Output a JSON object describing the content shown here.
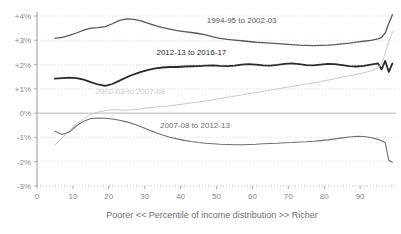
{
  "chart_data": {
    "type": "line",
    "title": "",
    "subtitle": "",
    "xlabel": "Poorer << Percentile of income distribution >> Richer",
    "ylabel": "",
    "xlim": [
      0,
      100
    ],
    "ylim": [
      -3,
      4
    ],
    "grid": true,
    "grid_style": "dotted",
    "legend_position": "inline-labels",
    "x_ticks": [
      0,
      10,
      20,
      30,
      40,
      50,
      60,
      70,
      80,
      90
    ],
    "x_tick_labels": [
      "0",
      "10",
      "20",
      "30",
      "40",
      "50",
      "60",
      "70",
      "80",
      "90"
    ],
    "y_ticks": [
      -3,
      -2,
      -1,
      0,
      1,
      2,
      3,
      4
    ],
    "y_tick_labels": [
      "-3%",
      "-2%",
      "-1%",
      "0%",
      "+1%",
      "+2%",
      "+3%",
      "+4%"
    ],
    "x": [
      5,
      7,
      9,
      11,
      13,
      15,
      17,
      19,
      21,
      23,
      25,
      27,
      29,
      31,
      33,
      35,
      37,
      39,
      41,
      43,
      45,
      47,
      49,
      51,
      53,
      55,
      57,
      59,
      61,
      63,
      65,
      67,
      69,
      71,
      73,
      75,
      77,
      79,
      81,
      83,
      85,
      87,
      89,
      91,
      93,
      95,
      96,
      97,
      98,
      99
    ],
    "series": [
      {
        "name": "1994-95 to 2002-03",
        "color": "#595959",
        "width": 1.3,
        "label_x": 57,
        "label_y": 3.72,
        "values": [
          3.08,
          3.12,
          3.2,
          3.3,
          3.42,
          3.5,
          3.52,
          3.56,
          3.68,
          3.82,
          3.88,
          3.86,
          3.8,
          3.7,
          3.6,
          3.52,
          3.46,
          3.4,
          3.36,
          3.32,
          3.28,
          3.22,
          3.14,
          3.08,
          3.04,
          3.01,
          2.98,
          2.95,
          2.92,
          2.9,
          2.88,
          2.86,
          2.84,
          2.82,
          2.8,
          2.79,
          2.78,
          2.79,
          2.8,
          2.82,
          2.85,
          2.88,
          2.92,
          2.96,
          3.0,
          3.06,
          3.12,
          3.3,
          3.7,
          4.05
        ]
      },
      {
        "name": "2012-13 to 2016-17",
        "color": "#2b2b2b",
        "width": 1.8,
        "label_x": 43,
        "label_y": 2.38,
        "values": [
          1.42,
          1.44,
          1.46,
          1.44,
          1.38,
          1.28,
          1.18,
          1.12,
          1.2,
          1.34,
          1.48,
          1.6,
          1.7,
          1.78,
          1.84,
          1.88,
          1.9,
          1.9,
          1.92,
          1.93,
          1.94,
          1.96,
          1.97,
          1.95,
          1.94,
          1.96,
          2.0,
          2.02,
          2.0,
          1.97,
          1.96,
          1.99,
          2.03,
          2.05,
          2.02,
          1.98,
          1.97,
          2.0,
          2.03,
          2.02,
          1.98,
          1.94,
          1.92,
          1.95,
          2.0,
          2.05,
          1.8,
          2.15,
          1.7,
          2.05
        ]
      },
      {
        "name": "2002-03 to 2007-08",
        "color": "#c9c9c9",
        "width": 1.0,
        "label_x": 26,
        "label_y": 0.78,
        "values": [
          -1.3,
          -1.02,
          -0.72,
          -0.44,
          -0.22,
          -0.06,
          0.04,
          0.1,
          0.14,
          0.13,
          0.12,
          0.14,
          0.18,
          0.22,
          0.25,
          0.27,
          0.3,
          0.34,
          0.38,
          0.42,
          0.46,
          0.5,
          0.55,
          0.6,
          0.65,
          0.7,
          0.75,
          0.8,
          0.85,
          0.9,
          0.95,
          1.0,
          1.05,
          1.1,
          1.15,
          1.2,
          1.25,
          1.3,
          1.36,
          1.42,
          1.48,
          1.54,
          1.6,
          1.66,
          1.74,
          1.86,
          2.05,
          2.45,
          2.95,
          3.35
        ]
      },
      {
        "name": "2007-08 to 2012-13",
        "color": "#6e6e6e",
        "width": 1.1,
        "label_x": 44,
        "label_y": -0.62,
        "values": [
          -0.75,
          -0.88,
          -0.78,
          -0.52,
          -0.33,
          -0.22,
          -0.2,
          -0.21,
          -0.24,
          -0.29,
          -0.36,
          -0.45,
          -0.56,
          -0.68,
          -0.8,
          -0.9,
          -0.99,
          -1.06,
          -1.12,
          -1.17,
          -1.21,
          -1.24,
          -1.26,
          -1.28,
          -1.29,
          -1.3,
          -1.3,
          -1.29,
          -1.28,
          -1.26,
          -1.25,
          -1.24,
          -1.22,
          -1.21,
          -1.19,
          -1.18,
          -1.16,
          -1.13,
          -1.1,
          -1.06,
          -1.02,
          -0.98,
          -0.95,
          -0.96,
          -1.0,
          -1.08,
          -1.14,
          -1.22,
          -1.95,
          -2.02
        ]
      }
    ]
  },
  "axis": {
    "x_title": "Poorer << Percentile of income distribution >> Richer"
  },
  "colors": {
    "grid": "#cccccc",
    "axis": "#999999",
    "zero_line": "#b0b0b0",
    "tick_text": "#8a8a8a",
    "axis_title": "#6f6f6f"
  }
}
